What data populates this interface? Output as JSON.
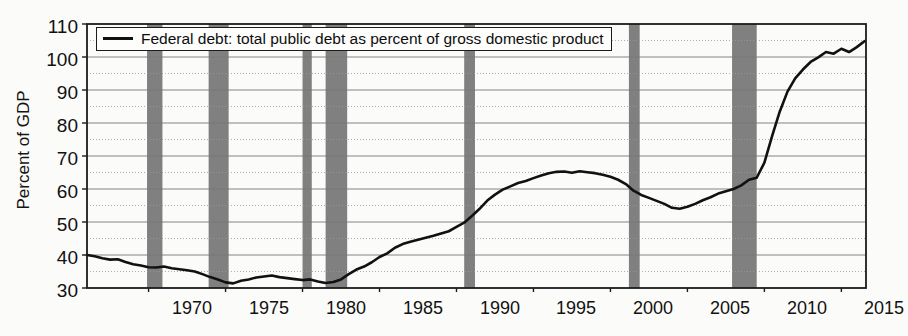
{
  "chart_data": {
    "type": "line",
    "title": "",
    "xlabel": "",
    "ylabel": "Percent of GDP",
    "xlim": [
      1966.0,
      2016.6
    ],
    "ylim": [
      30,
      110
    ],
    "xticks": [
      1970,
      1975,
      1980,
      1985,
      1990,
      1995,
      2000,
      2005,
      2010,
      2015
    ],
    "yticks": [
      30,
      40,
      50,
      60,
      70,
      80,
      90,
      100,
      110
    ],
    "grid": true,
    "legend_position": "upper left",
    "series": [
      {
        "name": "Federal debt: total public debt as percent of gross domestic product",
        "color": "#111111",
        "x": [
          1966.0,
          1966.5,
          1967.0,
          1967.5,
          1968.0,
          1968.5,
          1969.0,
          1969.5,
          1970.0,
          1970.5,
          1971.0,
          1971.5,
          1972.0,
          1972.5,
          1973.0,
          1973.5,
          1974.0,
          1974.5,
          1975.0,
          1975.5,
          1976.0,
          1976.5,
          1977.0,
          1977.5,
          1978.0,
          1978.5,
          1979.0,
          1979.5,
          1980.0,
          1980.5,
          1981.0,
          1981.5,
          1982.0,
          1982.5,
          1983.0,
          1983.5,
          1984.0,
          1984.5,
          1985.0,
          1985.5,
          1986.0,
          1986.5,
          1987.0,
          1987.5,
          1988.0,
          1988.5,
          1989.0,
          1989.5,
          1990.0,
          1990.5,
          1991.0,
          1991.5,
          1992.0,
          1992.5,
          1993.0,
          1993.5,
          1994.0,
          1994.5,
          1995.0,
          1995.5,
          1996.0,
          1996.5,
          1997.0,
          1997.5,
          1998.0,
          1998.5,
          1999.0,
          1999.5,
          2000.0,
          2000.5,
          2001.0,
          2001.5,
          2002.0,
          2002.5,
          2003.0,
          2003.5,
          2004.0,
          2004.5,
          2005.0,
          2005.5,
          2006.0,
          2006.5,
          2007.0,
          2007.5,
          2008.0,
          2008.5,
          2009.0,
          2009.5,
          2010.0,
          2010.5,
          2011.0,
          2011.5,
          2012.0,
          2012.5,
          2013.0,
          2013.5,
          2014.0,
          2014.5,
          2015.0,
          2015.5,
          2016.0,
          2016.5
        ],
        "y": [
          40.0,
          39.6,
          39.0,
          38.6,
          38.7,
          37.9,
          37.2,
          36.8,
          36.3,
          36.2,
          36.5,
          36.0,
          35.7,
          35.4,
          35.0,
          34.2,
          33.3,
          32.6,
          31.7,
          31.4,
          32.2,
          32.6,
          33.2,
          33.5,
          33.8,
          33.3,
          33.0,
          32.7,
          32.4,
          32.6,
          32.0,
          31.5,
          31.8,
          32.6,
          34.2,
          35.6,
          36.5,
          37.8,
          39.4,
          40.5,
          42.2,
          43.3,
          44.0,
          44.6,
          45.2,
          45.8,
          46.5,
          47.2,
          48.5,
          49.8,
          51.8,
          54.0,
          56.5,
          58.3,
          59.8,
          60.8,
          61.8,
          62.4,
          63.3,
          64.1,
          64.8,
          65.2,
          65.3,
          64.9,
          65.4,
          65.1,
          64.8,
          64.3,
          63.7,
          62.8,
          61.5,
          59.5,
          58.2,
          57.3,
          56.4,
          55.5,
          54.3,
          54.0,
          54.6,
          55.5,
          56.6,
          57.5,
          58.6,
          59.3,
          60.0,
          61.1,
          62.8,
          63.4,
          68.0,
          76.0,
          83.5,
          89.5,
          93.5,
          96.2,
          98.5,
          99.9,
          101.5,
          101.0,
          102.5,
          101.5,
          103.0,
          104.8
        ]
      }
    ],
    "recession_shading": {
      "color": "#808080",
      "periods": [
        {
          "start": 1969.9,
          "end": 1970.9
        },
        {
          "start": 1973.9,
          "end": 1975.2
        },
        {
          "start": 1980.0,
          "end": 1980.6
        },
        {
          "start": 1981.5,
          "end": 1982.9
        },
        {
          "start": 1990.5,
          "end": 1991.2
        },
        {
          "start": 2001.2,
          "end": 2001.9
        },
        {
          "start": 2007.9,
          "end": 2009.5
        }
      ]
    },
    "legend": [
      {
        "label": "Federal debt: total public debt as percent of gross domestic product",
        "marker": "line",
        "color": "#111111"
      }
    ]
  },
  "axis": {
    "ylabel": "Percent of GDP",
    "ytick_labels": [
      "110",
      "100",
      "90",
      "80",
      "70",
      "60",
      "50",
      "40",
      "30"
    ],
    "xtick_labels": [
      "1970",
      "1975",
      "1980",
      "1985",
      "1990",
      "1995",
      "2000",
      "2005",
      "2010",
      "2015"
    ]
  },
  "legend": {
    "entry_label": "Federal debt: total public debt as percent of gross domestic product"
  }
}
